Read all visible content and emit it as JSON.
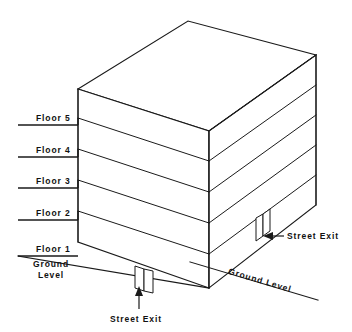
{
  "diagram": {
    "type": "isometric-building-elevation",
    "line_color": "#1a1a1a",
    "background_color": "#ffffff",
    "floor_labels": [
      {
        "id": "floor-5",
        "label": "Floor 5"
      },
      {
        "id": "floor-4",
        "label": "Floor 4"
      },
      {
        "id": "floor-3",
        "label": "Floor 3"
      },
      {
        "id": "floor-2",
        "label": "Floor 2"
      },
      {
        "id": "floor-1",
        "label": "Floor 1"
      }
    ],
    "ground_level_left": "Ground\nLevel",
    "ground_level_left_line1": "Ground",
    "ground_level_left_line2": "Level",
    "ground_level_right": "Ground Level",
    "street_exit_front": "Street Exit",
    "street_exit_right": "Street Exit",
    "floor_count": 5,
    "exits": [
      {
        "id": "exit-front",
        "label": "Street Exit",
        "face": "front-left",
        "arrow_direction": "up"
      },
      {
        "id": "exit-right",
        "label": "Street Exit",
        "face": "right",
        "arrow_direction": "left"
      }
    ]
  }
}
